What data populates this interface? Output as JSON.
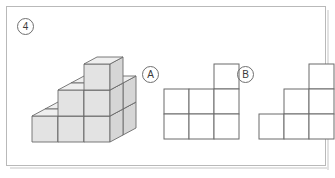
{
  "page": {
    "question_number": "4",
    "background_color": "#ffffff",
    "frame_color": "#b9b9b9"
  },
  "figure_3d": {
    "name": "isometric-cube-stack",
    "description": "Isometric staircase built from unit cubes",
    "cube_face_colors": {
      "top": "#efefef",
      "left": "#e3e3e3",
      "right": "#d6d6d6",
      "outline": "#6b6b6b"
    },
    "cube_size_px": 26,
    "iso_dx": 13,
    "iso_dy": 7,
    "cubes": [
      {
        "col": 0,
        "row": 0,
        "layer": 0
      },
      {
        "col": 1,
        "row": 0,
        "layer": 0
      },
      {
        "col": 2,
        "row": 0,
        "layer": 0
      },
      {
        "col": 0,
        "row": 1,
        "layer": 0
      },
      {
        "col": 1,
        "row": 1,
        "layer": 0
      },
      {
        "col": 2,
        "row": 1,
        "layer": 0
      },
      {
        "col": 1,
        "row": 0,
        "layer": 1
      },
      {
        "col": 2,
        "row": 0,
        "layer": 1
      },
      {
        "col": 1,
        "row": 1,
        "layer": 1
      },
      {
        "col": 2,
        "row": 1,
        "layer": 1
      },
      {
        "col": 2,
        "row": 0,
        "layer": 2
      }
    ]
  },
  "options": [
    {
      "id": "A",
      "label": "A",
      "name": "option-a",
      "cell_size_px": 25,
      "grid_cols": 3,
      "grid_rows": 3,
      "stroke_color": "#6b6b6b",
      "fill_color": "#ffffff",
      "filled_cells": [
        {
          "col": 2,
          "row": 0
        },
        {
          "col": 0,
          "row": 1
        },
        {
          "col": 1,
          "row": 1
        },
        {
          "col": 2,
          "row": 1
        },
        {
          "col": 0,
          "row": 2
        },
        {
          "col": 1,
          "row": 2
        },
        {
          "col": 2,
          "row": 2
        }
      ]
    },
    {
      "id": "B",
      "label": "B",
      "name": "option-b",
      "cell_size_px": 25,
      "grid_cols": 3,
      "grid_rows": 3,
      "stroke_color": "#6b6b6b",
      "fill_color": "#ffffff",
      "filled_cells": [
        {
          "col": 2,
          "row": 0
        },
        {
          "col": 1,
          "row": 1
        },
        {
          "col": 2,
          "row": 1
        },
        {
          "col": 0,
          "row": 2
        },
        {
          "col": 1,
          "row": 2
        },
        {
          "col": 2,
          "row": 2
        }
      ]
    }
  ]
}
